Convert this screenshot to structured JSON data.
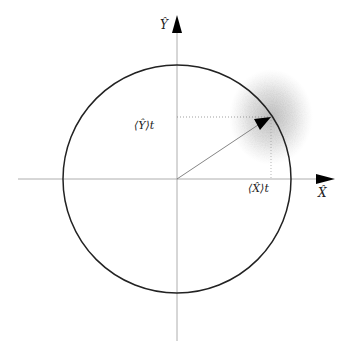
{
  "diagram": {
    "title": "",
    "axes": {
      "x_label": "X̂",
      "y_label": "Ŷ"
    },
    "markers": {
      "x_expectation": "⟨X̂⟩t",
      "y_expectation": "⟨Ŷ⟩t"
    },
    "geometry": {
      "center": [
        177,
        179
      ],
      "radius": 114,
      "state_point": [
        271,
        117
      ]
    },
    "colors": {
      "circle": "#222222",
      "axis": "#999999",
      "arrow": "#000000",
      "cloud": "#888888"
    }
  }
}
